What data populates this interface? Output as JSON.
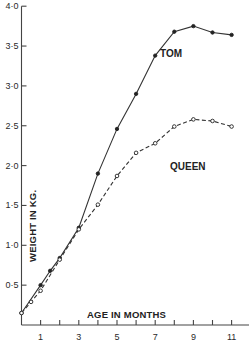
{
  "chart_data": {
    "type": "line",
    "title": "",
    "xlabel": "AGE IN MONTHS",
    "ylabel": "WEIGHT IN KG.",
    "xlim": [
      0,
      12
    ],
    "ylim": [
      0,
      4.0
    ],
    "x_ticks": [
      1,
      2,
      3,
      4,
      5,
      6,
      7,
      8,
      9,
      10,
      11
    ],
    "x_tick_labels": [
      "1",
      "",
      "3",
      "",
      "5",
      "",
      "7",
      "",
      "9",
      "",
      "11"
    ],
    "y_ticks": [
      0.5,
      1.0,
      1.5,
      2.0,
      2.5,
      3.0,
      3.5,
      4.0
    ],
    "y_tick_labels": [
      "0·5",
      "1·0",
      "1·5",
      "2·0",
      "2·5",
      "3·0",
      "3·5",
      "4·0"
    ],
    "grid": false,
    "legend": "inline labels",
    "series": [
      {
        "name": "TOM",
        "style": "solid line, filled dots",
        "x": [
          0,
          1,
          1.5,
          2,
          3,
          4,
          5,
          6,
          7,
          8,
          9,
          10,
          11
        ],
        "values": [
          0.15,
          0.5,
          0.68,
          0.84,
          1.22,
          1.9,
          2.46,
          2.9,
          3.38,
          3.68,
          3.75,
          3.67,
          3.64
        ]
      },
      {
        "name": "QUEEN",
        "style": "dashed line, open circles",
        "x": [
          0,
          0.5,
          1,
          2,
          3,
          4,
          5,
          6,
          7,
          8,
          9,
          10,
          11
        ],
        "values": [
          0.15,
          0.29,
          0.43,
          0.82,
          1.2,
          1.51,
          1.87,
          2.16,
          2.28,
          2.49,
          2.58,
          2.56,
          2.49
        ]
      }
    ]
  },
  "labels": {
    "tom": "TOM",
    "queen": "QUEEN",
    "x_axis_title": "AGE IN MONTHS",
    "y_axis_title": "WEIGHT IN KG."
  }
}
